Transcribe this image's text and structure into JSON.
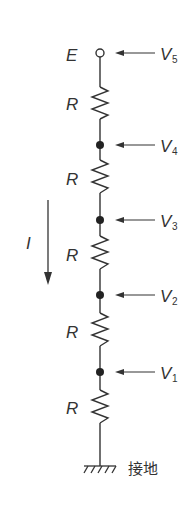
{
  "diagram": {
    "colors": {
      "line": "#333333",
      "background": "#ffffff"
    },
    "source_label": "E",
    "resistor_label": "R",
    "current_label": "I",
    "ground_label": "接地",
    "resistors": [
      {
        "label": "R"
      },
      {
        "label": "R"
      },
      {
        "label": "R"
      },
      {
        "label": "R"
      },
      {
        "label": "R"
      }
    ],
    "nodes": [
      {
        "name": "V",
        "sub": "5",
        "type": "terminal"
      },
      {
        "name": "V",
        "sub": "4",
        "type": "junction"
      },
      {
        "name": "V",
        "sub": "3",
        "type": "junction"
      },
      {
        "name": "V",
        "sub": "2",
        "type": "junction"
      },
      {
        "name": "V",
        "sub": "1",
        "type": "junction"
      }
    ]
  }
}
